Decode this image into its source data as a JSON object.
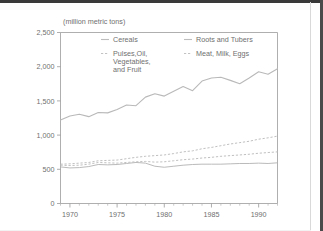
{
  "chart_data": {
    "type": "line",
    "title": "",
    "unit_label": "(million metric tons)",
    "xlabel": "",
    "ylabel": "",
    "xlim": [
      1969,
      1992
    ],
    "ylim": [
      0,
      2500
    ],
    "ytick_labels": [
      "0",
      "500",
      "1,000",
      "1,500",
      "2,000",
      "2,500"
    ],
    "ytick_values": [
      0,
      500,
      1000,
      1500,
      2000,
      2500
    ],
    "xtick_labels": [
      "1970",
      "1975",
      "1980",
      "1985",
      "1990"
    ],
    "xtick_values": [
      1970,
      1975,
      1980,
      1985,
      1990
    ],
    "grid": false,
    "legend_position": "inside-top",
    "x": [
      1969,
      1970,
      1971,
      1972,
      1973,
      1974,
      1975,
      1976,
      1977,
      1978,
      1979,
      1980,
      1981,
      1982,
      1983,
      1984,
      1985,
      1986,
      1987,
      1988,
      1989,
      1990,
      1991,
      1992
    ],
    "series": [
      {
        "name": "Cereals",
        "style": "solid",
        "values": [
          1220,
          1280,
          1305,
          1270,
          1330,
          1325,
          1375,
          1440,
          1430,
          1555,
          1605,
          1570,
          1640,
          1710,
          1650,
          1790,
          1835,
          1845,
          1800,
          1750,
          1835,
          1925,
          1890,
          1970
        ]
      },
      {
        "name": "Roots and Tubers",
        "style": "solid",
        "values": [
          535,
          520,
          525,
          540,
          570,
          565,
          570,
          585,
          600,
          590,
          545,
          530,
          545,
          560,
          570,
          575,
          575,
          575,
          580,
          585,
          585,
          590,
          585,
          595
        ]
      },
      {
        "name": "Pulses,Oil, Vegetables, and Fruit",
        "style": "dashed",
        "values": [
          575,
          580,
          590,
          600,
          625,
          630,
          635,
          655,
          675,
          690,
          700,
          710,
          730,
          755,
          770,
          800,
          820,
          845,
          870,
          890,
          910,
          940,
          960,
          985
        ]
      },
      {
        "name": "Meat, Milk, Eggs",
        "style": "dashed",
        "values": [
          560,
          555,
          560,
          575,
          600,
          595,
          590,
          600,
          610,
          615,
          605,
          610,
          625,
          640,
          650,
          665,
          675,
          690,
          700,
          710,
          720,
          735,
          745,
          755
        ]
      }
    ],
    "legend": [
      {
        "label": "Cereals",
        "style": "solid"
      },
      {
        "label": "Roots and Tubers",
        "style": "solid"
      },
      {
        "label": "Pulses,Oil,",
        "style": "dashed"
      },
      {
        "label": "Vegetables,",
        "style": "none"
      },
      {
        "label": "and Fruit",
        "style": "none"
      },
      {
        "label": "Meat, Milk, Eggs",
        "style": "dashed"
      }
    ]
  }
}
